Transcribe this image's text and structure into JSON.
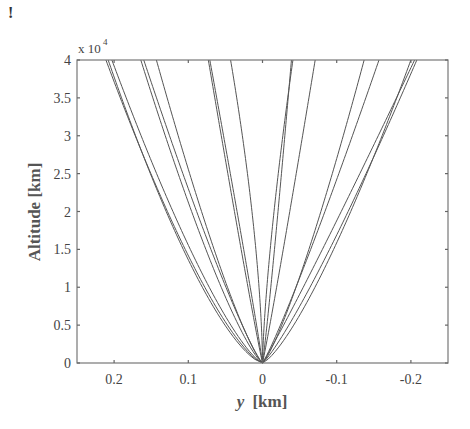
{
  "corner_mark": "!",
  "chart_data": {
    "type": "line",
    "title": "",
    "xlabel": "y [km]",
    "xlabel_var": "y",
    "xlabel_unit": "[km]",
    "ylabel": "Altitude [km]",
    "y_multiplier_label": "x 10",
    "y_multiplier_exponent": "4",
    "xlim": [
      0.25,
      -0.25
    ],
    "x_reversed": true,
    "ylim": [
      0,
      40000
    ],
    "grid": false,
    "legend": "none",
    "x_ticks": [
      0.2,
      0.1,
      0,
      -0.1,
      -0.2
    ],
    "x_tick_labels": [
      "0.2",
      "0.1",
      "0",
      "-0.1",
      "-0.2"
    ],
    "y_ticks": [
      0,
      5000,
      10000,
      15000,
      20000,
      25000,
      30000,
      35000,
      40000
    ],
    "y_tick_labels": [
      "0",
      "0.5",
      "1",
      "1.5",
      "2",
      "2.5",
      "3",
      "3.5",
      "4"
    ],
    "line_color": "#555555",
    "series_model": "y = y_at_top * (altitude / 40000) ^ shape",
    "series": [
      {
        "name": "trajectory-1",
        "y_at_top": 0.211,
        "shape": 0.72
      },
      {
        "name": "trajectory-2",
        "y_at_top": 0.208,
        "shape": 0.68
      },
      {
        "name": "trajectory-3",
        "y_at_top": 0.203,
        "shape": 0.75
      },
      {
        "name": "trajectory-4",
        "y_at_top": 0.164,
        "shape": 0.78
      },
      {
        "name": "trajectory-5",
        "y_at_top": 0.16,
        "shape": 0.85
      },
      {
        "name": "trajectory-6",
        "y_at_top": 0.143,
        "shape": 0.8
      },
      {
        "name": "trajectory-7",
        "y_at_top": 0.073,
        "shape": 0.95
      },
      {
        "name": "trajectory-8",
        "y_at_top": 0.071,
        "shape": 1.05
      },
      {
        "name": "trajectory-9",
        "y_at_top": 0.043,
        "shape": 1.6
      },
      {
        "name": "trajectory-10",
        "y_at_top": -0.039,
        "shape": 0.9
      },
      {
        "name": "trajectory-11",
        "y_at_top": -0.041,
        "shape": 1.4
      },
      {
        "name": "trajectory-12",
        "y_at_top": -0.071,
        "shape": 0.95
      },
      {
        "name": "trajectory-13",
        "y_at_top": -0.137,
        "shape": 0.8
      },
      {
        "name": "trajectory-14",
        "y_at_top": -0.157,
        "shape": 0.9
      },
      {
        "name": "trajectory-15",
        "y_at_top": -0.2,
        "shape": 0.75
      },
      {
        "name": "trajectory-16",
        "y_at_top": -0.205,
        "shape": 0.95
      },
      {
        "name": "trajectory-17",
        "y_at_top": -0.208,
        "shape": 0.85
      }
    ]
  }
}
